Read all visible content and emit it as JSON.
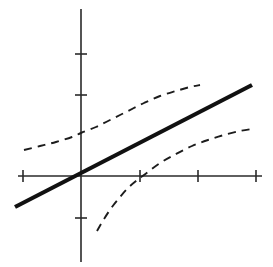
{
  "figure": {
    "title": "",
    "background_color": "#ffffff",
    "width": 273,
    "height": 267
  },
  "chart_data": {
    "type": "line",
    "title": "",
    "subtitle": "",
    "xlabel": "",
    "ylabel": "",
    "grid": false,
    "legend": false,
    "legend_position": "none",
    "axes": {
      "origin_px": {
        "x": 81,
        "y": 176
      },
      "x_axis": {
        "visible": true,
        "start_px": 18,
        "end_px": 262,
        "tick_values": [
          -1,
          0,
          1,
          2,
          3
        ],
        "tick_labels": [
          "",
          "",
          "",
          "",
          ""
        ],
        "tick_positions_px": [
          23,
          81,
          140,
          198,
          256
        ],
        "tick_half_length_px": 6,
        "unit_px": 58.5
      },
      "y_axis": {
        "visible": true,
        "start_px": 9,
        "end_px": 262,
        "tick_values": [
          -1,
          1,
          2
        ],
        "tick_labels": [
          "",
          "",
          ""
        ],
        "tick_positions_px": [
          218,
          95,
          54
        ],
        "tick_half_length_px": 6,
        "unit_px": 41
      }
    },
    "series": [
      {
        "name": "regression-line",
        "style": "solid",
        "stroke_color": "#111111",
        "stroke_width": 4.2,
        "points_px": [
          [
            15,
            207
          ],
          [
            252,
            85
          ]
        ],
        "slope_px_per_px": -0.5148,
        "intercept_px": 179.8,
        "description": "Fitted straight regression line passing near the origin"
      },
      {
        "name": "upper-confidence-band",
        "style": "dashed",
        "stroke_color": "#1c1c1c",
        "stroke_width": 1.9,
        "dash_pattern": [
          8,
          6
        ],
        "points_px": [
          [
            24,
            150
          ],
          [
            40,
            146
          ],
          [
            56,
            142
          ],
          [
            72,
            137
          ],
          [
            81,
            133
          ],
          [
            96,
            127
          ],
          [
            112,
            119
          ],
          [
            128,
            111
          ],
          [
            144,
            103
          ],
          [
            160,
            96
          ],
          [
            176,
            91
          ],
          [
            190,
            87
          ],
          [
            200,
            85
          ]
        ],
        "description": "Upper dashed hyperbolic confidence band, above the regression line"
      },
      {
        "name": "lower-confidence-band",
        "style": "dashed",
        "stroke_color": "#1c1c1c",
        "stroke_width": 1.9,
        "dash_pattern": [
          8,
          6
        ],
        "points_px": [
          [
            97,
            231
          ],
          [
            104,
            219
          ],
          [
            112,
            207
          ],
          [
            120,
            197
          ],
          [
            128,
            188
          ],
          [
            136,
            181
          ],
          [
            144,
            175
          ],
          [
            160,
            163
          ],
          [
            176,
            154
          ],
          [
            192,
            146
          ],
          [
            208,
            140
          ],
          [
            224,
            135
          ],
          [
            240,
            131
          ],
          [
            252,
            129
          ]
        ],
        "description": "Lower dashed hyperbolic confidence band, below the regression line"
      }
    ],
    "annotations": []
  },
  "colors": {
    "axis": "#2a2a2a",
    "line": "#111111",
    "band": "#1c1c1c",
    "background": "#ffffff"
  }
}
